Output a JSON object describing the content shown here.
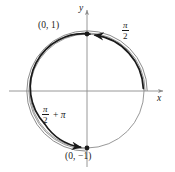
{
  "figure": {
    "kind": "unit-circle-wrapping-diagram",
    "background_color": "#ffffff",
    "ink_color": "#1a1a1a",
    "gray_color": "#8c8c8c",
    "axes": {
      "x_label": "x",
      "y_label": "y",
      "origin": {
        "x": 87,
        "y": 91
      },
      "x_line": {
        "from_x": 9,
        "to_x": 166,
        "y": 91
      },
      "y_line": {
        "x": 87,
        "from_y": 167,
        "to_y": 7
      },
      "has_arrowheads": true
    },
    "circle": {
      "center_x": 87,
      "center_y": 91,
      "radius": 57,
      "stroke_color": "#8c8c8c",
      "stroke_width": 0.9
    },
    "points": [
      {
        "name": "point-top",
        "label": "(0, 1)",
        "coords_x": 0,
        "coords_y": 1,
        "screen_x": 87,
        "screen_y": 34,
        "marker": "filled-dot"
      },
      {
        "name": "point-bottom",
        "label": "(0, −1)",
        "coords_x": 0,
        "coords_y": -1,
        "screen_x": 87,
        "screen_y": 148,
        "marker": "filled-dot"
      }
    ],
    "arc_labels": [
      {
        "name": "arc-label-pi-over-2",
        "numerator": "π",
        "denominator": "2",
        "suffix": "",
        "plain_text": "π/2",
        "position": "upper-right"
      },
      {
        "name": "arc-label-pi-over-2-plus-pi",
        "numerator": "π",
        "denominator": "2",
        "suffix": "+ π",
        "plus_sign": "+",
        "extra_term": "π",
        "plain_text": "π/2 + π",
        "position": "lower-left"
      }
    ],
    "traced_arcs": [
      {
        "name": "traced-arc-first-revolution",
        "description": "dark arc from (1,0) counterclockwise to (0,1)",
        "start_angle_deg": 0,
        "end_angle_deg": 90,
        "stroke_color": "#1a1a1a",
        "stroke_width": 1.6,
        "arrow_at_end": true
      },
      {
        "name": "traced-arc-second-revolution",
        "description": "dark arc continuing counterclockwise from (0,1) around to (0,-1)",
        "start_angle_deg": 90,
        "end_angle_deg": 270,
        "stroke_color": "#1a1a1a",
        "stroke_width": 1.6,
        "arrow_at_end": true
      },
      {
        "name": "companion-arc-outer",
        "description": "gray offset arc paralleling the traced path",
        "stroke_color": "#8c8c8c",
        "stroke_width": 0.9
      }
    ]
  }
}
